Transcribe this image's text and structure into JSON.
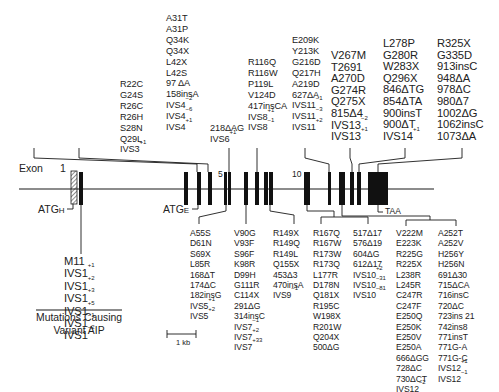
{
  "figure": {
    "exon_label": "Exon",
    "exon_numbers": [
      "1",
      "5",
      "10"
    ],
    "atg_h": "ATGH",
    "atg_e": "ATGE",
    "stop_codon": "TAA",
    "scale_bar": "1 kb",
    "variant_caption_line1": "Mutations Causing",
    "variant_caption_line2": "Variant AIP"
  },
  "top_groups": [
    {
      "name": "exon3",
      "items": [
        "R22C",
        "G24S",
        "R26C",
        "R26H",
        "S28N",
        "Q29L",
        "IVS3+1"
      ]
    },
    {
      "name": "exon4",
      "items": [
        "A31T",
        "A31P",
        "Q34K",
        "Q34X",
        "L42X",
        "L42S",
        "97 ΔA",
        "158insA",
        "IVS4−2",
        "IVS4−6",
        "IVS4+1"
      ]
    },
    {
      "name": "exon6",
      "items": [
        "218ΔAG",
        "IVS6+1"
      ]
    },
    {
      "name": "exon8",
      "items": [
        "R116Q",
        "R116W",
        "P119L",
        "V124D",
        "417insCA",
        "IVS8+1",
        "IVS8−1"
      ]
    },
    {
      "name": "exon11",
      "items": [
        "E209K",
        "Y213K",
        "G216D",
        "Q217H",
        "A219D",
        "627ΔA",
        "IVS11−1",
        "IVS11−3",
        "IVS11+2"
      ]
    },
    {
      "name": "exon13",
      "items": [
        "V267M",
        "T2691",
        "A270D",
        "G274R",
        "Q275X",
        "815Δ4",
        "IVS13−2",
        "IVS13+1"
      ]
    },
    {
      "name": "exon14",
      "items": [
        "L278P",
        "G280R",
        "W283X",
        "Q296X",
        "846ΔTG",
        "854ΔTA",
        "900insT",
        "900ΔT",
        "IVS14+1"
      ]
    },
    {
      "name": "exon15",
      "items": [
        "R325X",
        "G335D",
        "913insC",
        "948ΔA",
        "978ΔC",
        "980Δ7",
        "1002ΔG",
        "1062insC",
        "1073ΔA"
      ]
    }
  ],
  "bottom_groups": [
    {
      "name": "exon1-variant",
      "items": [
        "M11",
        "IVS1+1",
        "IVS1+2",
        "IVS1+3",
        "IVS1+5",
        "IVS1−1",
        "IVS1−2"
      ]
    },
    {
      "name": "exon5",
      "items": [
        "A55S",
        "D61N",
        "S69X",
        "L85R",
        "168ΔT",
        "174ΔC",
        "182insG",
        "IVS5+1",
        "IVS5+2"
      ]
    },
    {
      "name": "exon7",
      "items": [
        "V90G",
        "V93F",
        "S96F",
        "K98R",
        "D99H",
        "G111R",
        "C114X",
        "291ΔG",
        "314insC",
        "IVS7−1",
        "IVS7+2",
        "IVS7+33"
      ]
    },
    {
      "name": "exon9",
      "items": [
        "R149X",
        "R149Q",
        "R149L",
        "Q155X",
        "453Δ3",
        "470insA",
        "IVS9−1"
      ]
    },
    {
      "name": "exon10a",
      "items": [
        "R167Q",
        "R167W",
        "R173W",
        "R173Q",
        "L177R",
        "D178N",
        "Q181X",
        "R195C",
        "W198X",
        "R201W",
        "Q204X",
        "500ΔG"
      ]
    },
    {
      "name": "exon10b",
      "items": [
        "517Δ17",
        "576Δ19",
        "604ΔG",
        "612Δ17",
        "IVS10+2",
        "IVS10−31",
        "IVS10−81"
      ]
    },
    {
      "name": "exon12a",
      "items": [
        "V222M",
        "E223K",
        "R225G",
        "R225X",
        "L238R",
        "L245R",
        "C247R",
        "C247F",
        "E250Q",
        "E250K",
        "E250V",
        "E250A",
        "666ΔGG",
        "728ΔC",
        "730ΔCT",
        "IVS12−2"
      ]
    },
    {
      "name": "exon12b",
      "items": [
        "A252T",
        "A252V",
        "H256Y",
        "H256N",
        "691Δ30",
        "715ΔCA",
        "716insC",
        "720ΔC",
        "723ins 21",
        "742ins8",
        "771insT",
        "771G-A",
        "771G-C",
        "IVS12+1",
        "IVS12−1"
      ]
    }
  ],
  "colors": {
    "ink": "#1a1a1a",
    "background": "#ffffff"
  }
}
